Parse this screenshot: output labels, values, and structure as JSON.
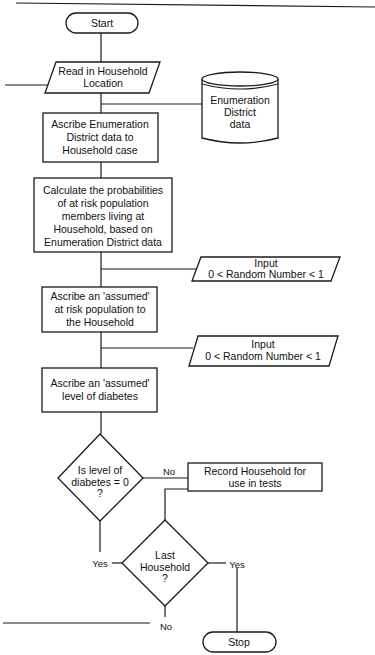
{
  "diagram": {
    "type": "flowchart",
    "colors": {
      "background": "#ffffff",
      "stroke": "#1a1a1a",
      "text": "#111111"
    },
    "nodes": {
      "start": {
        "shape": "terminal",
        "lines": [
          "Start"
        ]
      },
      "read_location": {
        "shape": "input-output",
        "lines": [
          "Read in Household",
          "Location"
        ]
      },
      "ed_data": {
        "shape": "database",
        "lines": [
          "Enumeration",
          "District",
          "data"
        ]
      },
      "ascribe_ed": {
        "shape": "process",
        "lines": [
          "Ascribe Enumeration",
          "District data to",
          "Household case"
        ]
      },
      "calc_prob": {
        "shape": "process",
        "lines": [
          "Calculate the probabilities",
          "of at risk population",
          "members living at",
          "Household, based on",
          "Enumeration District data"
        ]
      },
      "input_random_1": {
        "shape": "input-output",
        "lines": [
          "Input",
          "0 < Random Number < 1"
        ]
      },
      "ascribe_pop": {
        "shape": "process",
        "lines": [
          "Ascribe an 'assumed'",
          "at risk population to",
          "the Household"
        ]
      },
      "input_random_2": {
        "shape": "input-output",
        "lines": [
          "Input",
          "0 < Random Number < 1"
        ]
      },
      "ascribe_diabetes": {
        "shape": "process",
        "lines": [
          "Ascribe an 'assumed'",
          "level of diabetes"
        ]
      },
      "decision_diabetes": {
        "shape": "decision",
        "lines": [
          "Is level of",
          "diabetes = 0",
          "?"
        ]
      },
      "record_household": {
        "shape": "process",
        "lines": [
          "Record Household for",
          "use in tests"
        ]
      },
      "decision_last": {
        "shape": "decision",
        "lines": [
          "Last",
          "Household",
          "?"
        ]
      },
      "stop": {
        "shape": "terminal",
        "lines": [
          "Stop"
        ]
      }
    },
    "edge_labels": {
      "diabetes_no": "No",
      "diabetes_yes": "Yes",
      "last_yes": "Yes",
      "last_no": "No"
    },
    "edges": [
      [
        "start",
        "read_location"
      ],
      [
        "read_location",
        "ascribe_ed"
      ],
      [
        "ed_data",
        "ascribe_ed"
      ],
      [
        "ascribe_ed",
        "calc_prob"
      ],
      [
        "calc_prob",
        "ascribe_pop"
      ],
      [
        "input_random_1",
        "ascribe_pop"
      ],
      [
        "ascribe_pop",
        "ascribe_diabetes"
      ],
      [
        "input_random_2",
        "ascribe_diabetes"
      ],
      [
        "ascribe_diabetes",
        "decision_diabetes"
      ],
      [
        "decision_diabetes",
        "record_household",
        "No"
      ],
      [
        "decision_diabetes",
        "decision_last",
        "Yes"
      ],
      [
        "record_household",
        "decision_last"
      ],
      [
        "decision_last",
        "stop",
        "Yes"
      ],
      [
        "decision_last",
        "read_location",
        "No"
      ]
    ]
  }
}
